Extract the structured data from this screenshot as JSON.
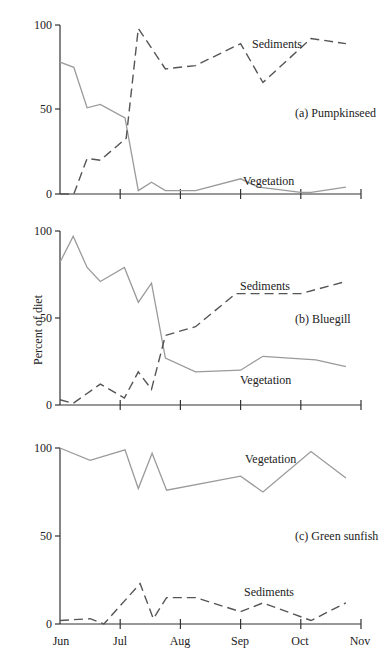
{
  "chart_data": [
    {
      "type": "line",
      "title": "(a) Pumpkinseed",
      "xlabel": "",
      "ylabel": "Percent of diet",
      "ylim": [
        0,
        100
      ],
      "yticks": [
        0,
        50,
        100
      ],
      "xticks": [
        "Jun",
        "Jul",
        "Aug",
        "Sep",
        "Oct",
        "Nov"
      ],
      "grid": false,
      "series": [
        {
          "name": "Vegetation",
          "style": "solid",
          "x": [
            0,
            0.23,
            0.45,
            0.67,
            1.08,
            1.3,
            1.52,
            1.75,
            2.25,
            3.0,
            3.3,
            4.0,
            4.17,
            4.75
          ],
          "values": [
            78,
            75,
            51,
            53,
            45,
            2,
            7,
            2,
            2,
            9,
            4,
            1,
            1,
            4
          ]
        },
        {
          "name": "Sediments",
          "style": "dashed",
          "x": [
            0,
            0.23,
            0.45,
            0.67,
            1.1,
            1.3,
            1.75,
            2.25,
            3.0,
            3.37,
            4.17,
            4.75
          ],
          "values": [
            0,
            0,
            21,
            20,
            33,
            98,
            74,
            76,
            89,
            66,
            92,
            89
          ]
        }
      ]
    },
    {
      "type": "line",
      "title": "(b) Bluegill",
      "xlabel": "",
      "ylabel": "Percent of diet",
      "ylim": [
        0,
        100
      ],
      "yticks": [
        0,
        50,
        100
      ],
      "xticks": [
        "Jun",
        "Jul",
        "Aug",
        "Sep",
        "Oct",
        "Nov"
      ],
      "grid": false,
      "series": [
        {
          "name": "Vegetation",
          "style": "solid",
          "x": [
            0,
            0.22,
            0.45,
            0.67,
            1.07,
            1.3,
            1.52,
            1.75,
            2.25,
            3.0,
            3.37,
            4.25,
            4.75
          ],
          "values": [
            82,
            97,
            79,
            71,
            79,
            59,
            70,
            27,
            19,
            20,
            28,
            26,
            22
          ]
        },
        {
          "name": "Sediments",
          "style": "dashed",
          "x": [
            0,
            0.22,
            0.67,
            1.07,
            1.3,
            1.52,
            1.75,
            2.25,
            2.92,
            4.0,
            4.75
          ],
          "values": [
            3,
            1,
            12,
            4,
            19,
            9,
            40,
            45,
            64,
            64,
            71
          ]
        }
      ]
    },
    {
      "type": "line",
      "title": "(c) Green sunfish",
      "xlabel": "",
      "ylabel": "Percent of diet",
      "ylim": [
        0,
        100
      ],
      "yticks": [
        0,
        50,
        100
      ],
      "xticks": [
        "Jun",
        "Jul",
        "Aug",
        "Sep",
        "Oct",
        "Nov"
      ],
      "grid": false,
      "series": [
        {
          "name": "Vegetation",
          "style": "solid",
          "x": [
            0,
            0.5,
            1.08,
            1.3,
            1.53,
            1.77,
            3.0,
            3.37,
            4.17,
            4.75
          ],
          "values": [
            100,
            93,
            99,
            77,
            97,
            76,
            84,
            75,
            98,
            83
          ]
        },
        {
          "name": "Sediments",
          "style": "dashed",
          "x": [
            0,
            0.5,
            0.73,
            1.33,
            1.55,
            1.77,
            2.25,
            3.0,
            3.37,
            4.17,
            4.75
          ],
          "values": [
            2,
            3,
            0,
            23,
            3,
            15,
            15,
            7,
            12,
            2,
            12
          ]
        }
      ]
    }
  ],
  "labels": {
    "ylabel": "Percent of diet",
    "months": [
      "Jun",
      "Jul",
      "Aug",
      "Sep",
      "Oct",
      "Nov"
    ],
    "panel_a": {
      "title": "(a) Pumpkinseed",
      "sed": "Sediments",
      "veg": "Vegetation",
      "y0": "0",
      "y50": "50",
      "y100": "100"
    },
    "panel_b": {
      "title": "(b) Bluegill",
      "sed": "Sediments",
      "veg": "Vegetation",
      "y0": "0",
      "y50": "50",
      "y100": "100"
    },
    "panel_c": {
      "title": "(c) Green sunfish",
      "sed": "Sediments",
      "veg": "Vegetation",
      "y0": "0",
      "y50": "50",
      "y100": "100"
    }
  },
  "colors": {
    "vegetation": "#9a9a9a",
    "sediments": "#555555",
    "axis": "#333333"
  }
}
